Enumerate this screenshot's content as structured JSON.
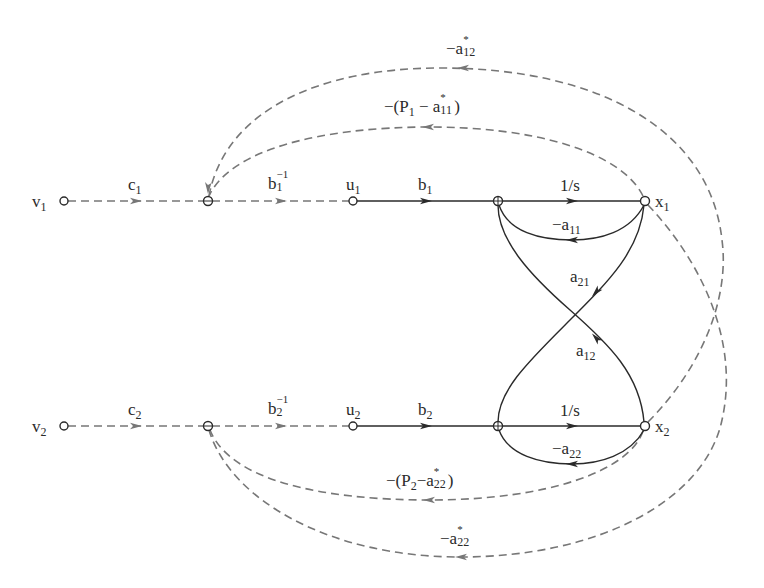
{
  "diagram": {
    "type": "signal-flow-graph",
    "colors": {
      "solid_edge": "#2a2a2a",
      "dashed_edge": "#777777",
      "text": "#2a2a2a",
      "background": "#ffffff"
    },
    "nodes": [
      {
        "id": "v1",
        "label": "v",
        "sub": "1",
        "x": 64,
        "y": 201
      },
      {
        "id": "j1",
        "label": "",
        "x": 208,
        "y": 201
      },
      {
        "id": "u1",
        "label": "u",
        "sub": "1",
        "x": 353,
        "y": 201
      },
      {
        "id": "s1",
        "label": "",
        "x": 498,
        "y": 201
      },
      {
        "id": "x1",
        "label": "x",
        "sub": "1",
        "x": 645,
        "y": 201
      },
      {
        "id": "v2",
        "label": "v",
        "sub": "2",
        "x": 64,
        "y": 426
      },
      {
        "id": "j2",
        "label": "",
        "x": 208,
        "y": 426
      },
      {
        "id": "u2",
        "label": "u",
        "sub": "2",
        "x": 353,
        "y": 426
      },
      {
        "id": "s2",
        "label": "",
        "x": 498,
        "y": 426
      },
      {
        "id": "x2",
        "label": "x",
        "sub": "2",
        "x": 645,
        "y": 426
      }
    ],
    "edges": {
      "c1": {
        "from": "v1",
        "to": "j1",
        "style": "dashed",
        "base": "c",
        "sub": "1"
      },
      "binv1": {
        "from": "j1",
        "to": "u1",
        "style": "dashed",
        "base": "b",
        "sub": "1",
        "sup": "−1"
      },
      "b1": {
        "from": "u1",
        "to": "s1",
        "style": "solid",
        "base": "b",
        "sub": "1"
      },
      "int1": {
        "from": "s1",
        "to": "x1",
        "style": "solid",
        "text": "1/s"
      },
      "a11": {
        "from": "x1",
        "to": "s1",
        "style": "solid",
        "base": "−a",
        "sub": "11"
      },
      "a21": {
        "from": "x1",
        "to": "s2",
        "style": "solid",
        "base": "a",
        "sub": "21"
      },
      "a12": {
        "from": "x2",
        "to": "s1",
        "style": "solid",
        "base": "a",
        "sub": "12"
      },
      "c2": {
        "from": "v2",
        "to": "j2",
        "style": "dashed",
        "base": "c",
        "sub": "2"
      },
      "binv2": {
        "from": "j2",
        "to": "u2",
        "style": "dashed",
        "base": "b",
        "sub": "2",
        "sup": "−1"
      },
      "b2": {
        "from": "u2",
        "to": "s2",
        "style": "solid",
        "base": "b",
        "sub": "2"
      },
      "int2": {
        "from": "s2",
        "to": "x2",
        "style": "solid",
        "text": "1/s"
      },
      "a22": {
        "from": "x2",
        "to": "s2",
        "style": "solid",
        "base": "−a",
        "sub": "22"
      },
      "p1": {
        "from": "x1",
        "to": "j1",
        "style": "dashed",
        "pre": "−(P",
        "psub": "1",
        "mid": " − a",
        "star": "*",
        "asub": "11",
        "post": ")"
      },
      "astar12": {
        "from": "x2",
        "to": "j1",
        "style": "dashed",
        "base": "−a",
        "star": "*",
        "sub": "12"
      },
      "p2": {
        "from": "x2",
        "to": "j2",
        "style": "dashed",
        "pre": "−(P",
        "psub": "2",
        "mid": "−a",
        "star": "*",
        "asub": "22",
        "post": ")"
      },
      "astar22": {
        "from": "x1",
        "to": "j2",
        "style": "dashed",
        "base": "−a",
        "star": "*",
        "sub": "22"
      }
    }
  }
}
